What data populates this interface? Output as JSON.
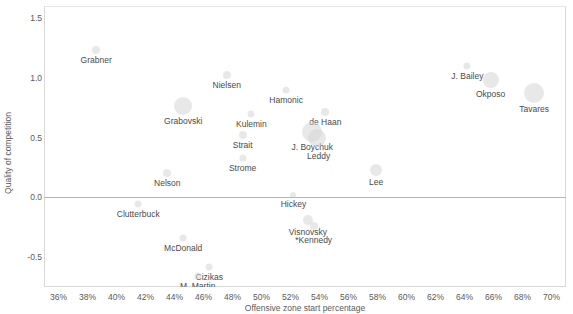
{
  "chart_data": {
    "type": "scatter",
    "title": "",
    "xlabel": "Offensive zone start percentage",
    "ylabel": "Quality of competition",
    "xlim": [
      35,
      71
    ],
    "ylim": [
      -0.75,
      1.6
    ],
    "xticks": [
      "36%",
      "38%",
      "40%",
      "42%",
      "44%",
      "46%",
      "48%",
      "50%",
      "52%",
      "54%",
      "56%",
      "58%",
      "60%",
      "62%",
      "64%",
      "66%",
      "68%",
      "70%"
    ],
    "xtick_values": [
      36,
      38,
      40,
      42,
      44,
      46,
      48,
      50,
      52,
      54,
      56,
      58,
      60,
      62,
      64,
      66,
      68,
      70
    ],
    "yticks": [
      "1.5",
      "1.0",
      "0.5",
      "0.0",
      "-0.5"
    ],
    "ytick_values": [
      1.5,
      1.0,
      0.5,
      0.0,
      -0.5
    ],
    "grid": false,
    "legend": "none",
    "zero_line": 0.0,
    "bubble_color": "#d6d6d6",
    "label_color": "#4a4a4a",
    "axis_color": "#5a5a5a",
    "size_encoding": "ice time",
    "points": [
      {
        "label": "Grabner",
        "x": 38.6,
        "y": 1.23,
        "r": 4,
        "label_dx": 0,
        "label_dy": 5
      },
      {
        "label": "Nielsen",
        "x": 47.6,
        "y": 1.02,
        "r": 4,
        "label_dx": 0,
        "label_dy": 5
      },
      {
        "label": "J. Bailey",
        "x": 64.2,
        "y": 1.1,
        "r": 3.5,
        "label_dx": 0,
        "label_dy": 5
      },
      {
        "label": "Hamonic",
        "x": 51.7,
        "y": 0.9,
        "r": 3.5,
        "label_dx": 0,
        "label_dy": 5
      },
      {
        "label": "Okposo",
        "x": 65.8,
        "y": 0.98,
        "r": 8,
        "label_dx": 0,
        "label_dy": 9
      },
      {
        "label": "Tavares",
        "x": 68.8,
        "y": 0.87,
        "r": 10,
        "label_dx": 0,
        "label_dy": 11
      },
      {
        "label": "Grabovski",
        "x": 44.6,
        "y": 0.76,
        "r": 9,
        "label_dx": 0,
        "label_dy": 10
      },
      {
        "label": "Kulemin",
        "x": 49.3,
        "y": 0.7,
        "r": 3.5,
        "label_dx": 0,
        "label_dy": 5
      },
      {
        "label": "de Haan",
        "x": 54.4,
        "y": 0.71,
        "r": 4,
        "label_dx": 0,
        "label_dy": 5
      },
      {
        "label": "Strait",
        "x": 48.7,
        "y": 0.52,
        "r": 4,
        "label_dx": 0,
        "label_dy": 5
      },
      {
        "label": "J. Boychuk",
        "x": 53.5,
        "y": 0.55,
        "r": 10,
        "label_dx": 0,
        "label_dy": 10
      },
      {
        "label": "Leddy",
        "x": 53.8,
        "y": 0.5,
        "r": 9,
        "label_dx": 2,
        "label_dy": 13
      },
      {
        "label": "Strome",
        "x": 48.7,
        "y": 0.33,
        "r": 3.5,
        "label_dx": 0,
        "label_dy": 5
      },
      {
        "label": "Nelson",
        "x": 43.5,
        "y": 0.2,
        "r": 4,
        "label_dx": 0,
        "label_dy": 5
      },
      {
        "label": "Lee",
        "x": 57.9,
        "y": 0.23,
        "r": 6,
        "label_dx": 0,
        "label_dy": 7
      },
      {
        "label": "Hickey",
        "x": 52.2,
        "y": 0.02,
        "r": 3,
        "label_dx": 0,
        "label_dy": 4
      },
      {
        "label": "Clutterbuck",
        "x": 41.5,
        "y": -0.06,
        "r": 3.5,
        "label_dx": 0,
        "label_dy": 5
      },
      {
        "label": "Visnovsky",
        "x": 53.2,
        "y": -0.19,
        "r": 5,
        "label_dx": 0,
        "label_dy": 7
      },
      {
        "label": "*Kennedy",
        "x": 53.6,
        "y": -0.24,
        "r": 4,
        "label_dx": 0,
        "label_dy": 9
      },
      {
        "label": "McDonald",
        "x": 44.6,
        "y": -0.34,
        "r": 3.5,
        "label_dx": 0,
        "label_dy": 5
      },
      {
        "label": "Cizikas",
        "x": 46.4,
        "y": -0.58,
        "r": 3.5,
        "label_dx": 0,
        "label_dy": 5
      },
      {
        "label": "M. Martin",
        "x": 45.6,
        "y": -0.66,
        "r": 3.5,
        "label_dx": 0,
        "label_dy": 5
      }
    ]
  }
}
